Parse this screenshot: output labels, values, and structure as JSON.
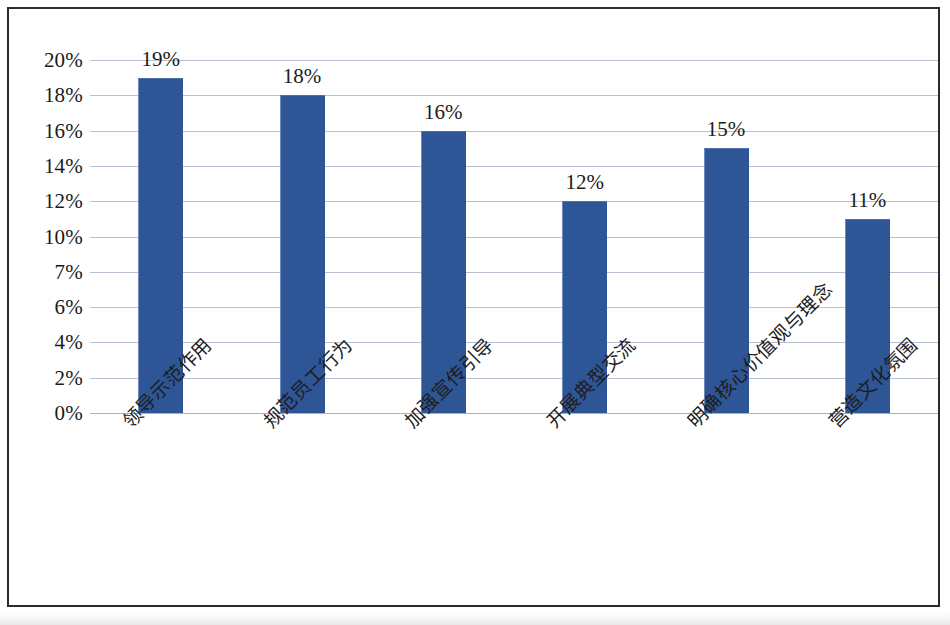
{
  "chart_data": {
    "type": "bar",
    "title": "",
    "subtitle": "",
    "xlabel": "",
    "ylabel": "",
    "categories": [
      "领导示范作用",
      "规范员工行为",
      "加强宣传引导",
      "开展典型交流",
      "明确核心价值观与理念",
      "营造文化氛围"
    ],
    "values": [
      19,
      18,
      16,
      12,
      15,
      11
    ],
    "data_labels": [
      "19%",
      "18%",
      "16%",
      "12%",
      "15%",
      "11%"
    ],
    "y_tick_labels": [
      "20%",
      "18%",
      "16%",
      "14%",
      "12%",
      "10%",
      "7%",
      "6%",
      "4%",
      "2%",
      "0%"
    ],
    "y_tick_values": [
      20,
      18,
      16,
      14,
      12,
      10,
      7,
      6,
      4,
      2,
      0
    ],
    "ylim": [
      0,
      20
    ],
    "grid": true,
    "legend": false,
    "legend_position": "none",
    "bar_color": "#2e5596",
    "gridline_color": "#aab4c8",
    "text_color": "#1b1b1b",
    "frame_color": "#2b2b2b",
    "category_label_rotation": -45
  }
}
